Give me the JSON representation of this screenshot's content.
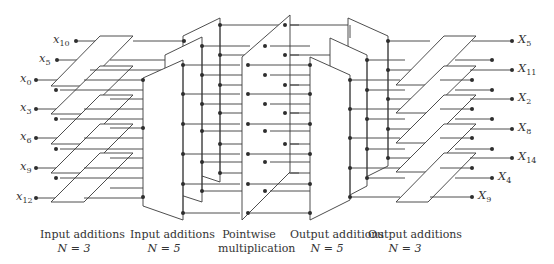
{
  "diagram": {
    "inputs": [
      {
        "sym": "x",
        "sub": "10"
      },
      {
        "sym": "x",
        "sub": "5"
      },
      {
        "sym": "x",
        "sub": "0"
      },
      {
        "sym": "x",
        "sub": "3"
      },
      {
        "sym": "x",
        "sub": "6"
      },
      {
        "sym": "x",
        "sub": "9"
      },
      {
        "sym": "x",
        "sub": "12"
      }
    ],
    "outputs": [
      {
        "sym": "X",
        "sub": "5"
      },
      {
        "sym": "X",
        "sub": "11"
      },
      {
        "sym": "X",
        "sub": "2"
      },
      {
        "sym": "X",
        "sub": "8"
      },
      {
        "sym": "X",
        "sub": "14"
      },
      {
        "sym": "X",
        "sub": "4"
      },
      {
        "sym": "X",
        "sub": "9"
      }
    ],
    "stages": [
      {
        "line1": "Input additions",
        "line2": "N = 3"
      },
      {
        "line1": "Input additions",
        "line2": "N = 5"
      },
      {
        "line1": "Pointwise",
        "line2": "multiplication"
      },
      {
        "line1": "Output additions",
        "line2": "N = 5"
      },
      {
        "line1": "Output additions",
        "line2": "N = 3"
      }
    ]
  }
}
